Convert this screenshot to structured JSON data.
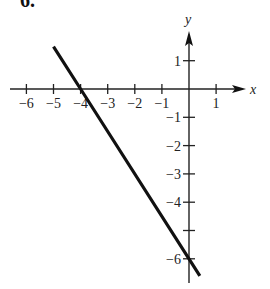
{
  "problem": {
    "number": "6."
  },
  "chart_data": {
    "type": "line",
    "title": "",
    "xlabel": "x",
    "ylabel": "y",
    "xlim": [
      -6.5,
      1.5
    ],
    "ylim": [
      -6.5,
      1.8
    ],
    "grid": false,
    "x_ticks": [
      -6,
      -5,
      -4,
      -3,
      -2,
      -1,
      1
    ],
    "x_tick_labels": [
      "−6",
      "−5",
      "−4",
      "−3",
      "−2",
      "−1",
      "1"
    ],
    "y_ticks": [
      1,
      -1,
      -2,
      -3,
      -4,
      -5,
      -6
    ],
    "y_tick_labels": [
      "1",
      "−1",
      "−2",
      "−3",
      "−4",
      "",
      "−6"
    ],
    "series": [
      {
        "name": "line",
        "equation": "y = -1.5x - 6",
        "x": [
          -5,
          -4,
          0,
          0.4
        ],
        "y": [
          1.5,
          0,
          -6,
          -6.6
        ]
      }
    ],
    "annotations": []
  }
}
